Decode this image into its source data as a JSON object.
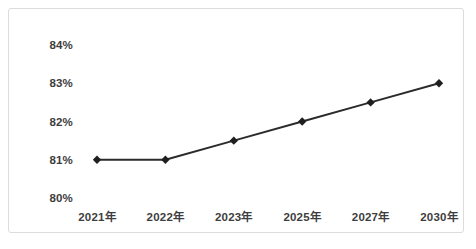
{
  "chart_data": {
    "type": "line",
    "title": "",
    "subtitle": "",
    "xlabel": "",
    "ylabel": "",
    "categories": [
      "2021年",
      "2022年",
      "2023年",
      "2025年",
      "2027年",
      "2030年"
    ],
    "values": [
      81,
      81,
      81.5,
      82,
      82.5,
      83
    ],
    "value_labels": [
      "81%",
      "81%",
      "81.5%",
      "82%",
      "82.5%",
      "83%"
    ],
    "ylim": [
      80,
      84
    ],
    "ytick_values": [
      84,
      83,
      82,
      81,
      80
    ],
    "ytick_labels": [
      "84%",
      "83%",
      "82%",
      "81%",
      "80%"
    ],
    "grid": false,
    "legend": null,
    "legend_position": "none",
    "series": [
      {
        "name": "",
        "values": [
          81,
          81,
          81.5,
          82,
          82.5,
          83
        ],
        "line_color": "#2b2b2b",
        "marker": "diamond",
        "marker_color": "#1f1f1f"
      }
    ],
    "colors": {
      "line": "#2b2b2b",
      "marker": "#1f1f1f",
      "text": "#3d3d3d",
      "border": "#dcdcdc",
      "background": "#ffffff"
    }
  }
}
